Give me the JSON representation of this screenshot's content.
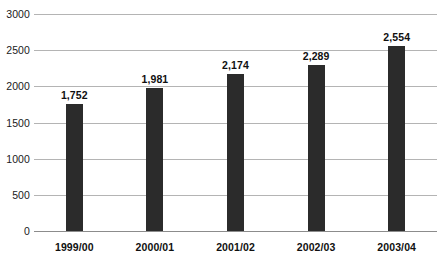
{
  "chart_data": {
    "type": "bar",
    "title": "",
    "subtitle": "",
    "xlabel": "",
    "ylabel": "",
    "categories": [
      "1999/00",
      "2000/01",
      "2001/02",
      "2002/03",
      "2003/04"
    ],
    "values": [
      1752,
      1981,
      2174,
      2289,
      2554
    ],
    "value_labels": [
      "1,752",
      "1,981",
      "2,174",
      "2,289",
      "2,554"
    ],
    "ylim": [
      0,
      3000
    ],
    "ytick_values": [
      0,
      500,
      1000,
      1500,
      2000,
      2500,
      3000
    ],
    "ytick_labels": [
      "0",
      "500",
      "1000",
      "1500",
      "2000",
      "2500",
      "3000"
    ],
    "grid": true,
    "legend": "none",
    "bar_color": "#2b2b2b",
    "gridline_color": "#b4b4b4",
    "axis_color": "#8c8c8c",
    "background_color": "#ffffff",
    "text_color": "#101010"
  }
}
